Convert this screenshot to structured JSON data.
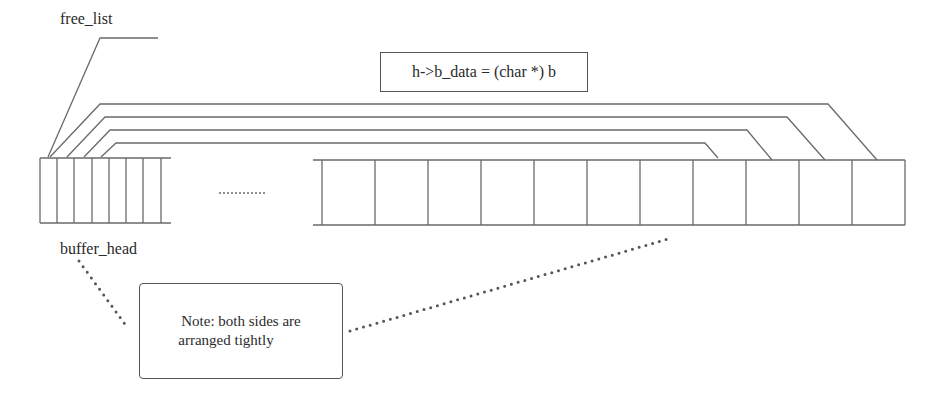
{
  "diagram": {
    "labels": {
      "free_list": "free_list",
      "buffer_head": "buffer_head",
      "ellipsis": "..........."
    },
    "formula_box": {
      "text": "h->b_data = (char *) b"
    },
    "note_box": {
      "line1": "Note: both sides are",
      "line2": "arranged tightly"
    },
    "left_array": {
      "name": "buffer_head array",
      "cell_count": 7,
      "open_right": true
    },
    "right_array": {
      "name": "data buffer array",
      "cell_count": 11,
      "open_left": true
    },
    "pointer_lines": 4,
    "colors": {
      "line": "#666666",
      "text": "#2b2b2b",
      "dots": "#555555"
    }
  }
}
